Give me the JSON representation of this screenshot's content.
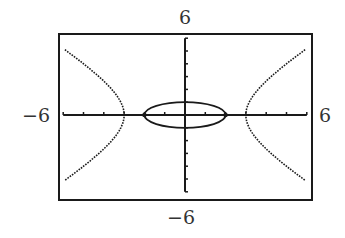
{
  "chart_data": {
    "type": "line",
    "title": "",
    "xlabel": "",
    "ylabel": "",
    "xlim": [
      -6,
      6
    ],
    "ylim": [
      -6,
      6
    ],
    "grid": false,
    "axis_labels": {
      "top": "6",
      "bottom": "−6",
      "left": "−6",
      "right": "6"
    },
    "x_ticks": [
      -6,
      -5,
      -4,
      -3,
      -2,
      -1,
      1,
      2,
      3,
      4,
      5,
      6
    ],
    "y_ticks": [
      -6,
      -5,
      -4,
      -3,
      -2,
      -1,
      1,
      2,
      3,
      4,
      5,
      6
    ],
    "series": [
      {
        "name": "ellipse",
        "equation": "x^2/4 + y^2 = 1",
        "a": 2,
        "b": 1
      },
      {
        "name": "hyperbola",
        "equation": "x^2/9 - y^2/9 = 1",
        "a": 3,
        "b": 3
      }
    ],
    "intersections_marked": [
      [
        -2,
        0
      ],
      [
        2,
        0
      ]
    ]
  },
  "colors": {
    "curve": "#1a1a1a",
    "frame": "#1a1a1a",
    "background": "#ffffff"
  }
}
